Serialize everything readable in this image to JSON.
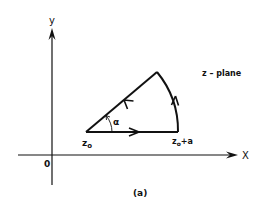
{
  "figure": {
    "plane_label": "z – plane",
    "caption": "(a)",
    "colors": {
      "ink": "#111111",
      "background": "#ffffff"
    }
  },
  "axes": {
    "x_label": "X",
    "y_label": "y",
    "origin_label": "0"
  },
  "contour": {
    "start_point_label": "z",
    "start_point_subscript": "o",
    "end_point_label": "z",
    "end_point_subscript": "o",
    "end_point_suffix": "+a",
    "angle_label": "α",
    "segments": [
      {
        "name": "straight segment from z0 to z0+a",
        "direction": "right"
      },
      {
        "name": "circular arc from z0+a to apex",
        "direction": "up"
      },
      {
        "name": "straight segment from apex back to z0",
        "direction": "down-left"
      }
    ]
  }
}
